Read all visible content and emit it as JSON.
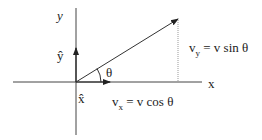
{
  "diagram": {
    "axis_x_label": "x",
    "axis_y_label": "y",
    "unit_x_label": "x̂",
    "unit_y_label": "ŷ",
    "angle_label": "θ",
    "vy_prefix": "v",
    "vy_sub": "y",
    "vy_rhs": "= v sin θ",
    "vx_prefix": "v",
    "vx_sub": "x",
    "vx_rhs": "= v cos θ",
    "colors": {
      "line": "#333333",
      "dashed": "#888888"
    }
  }
}
